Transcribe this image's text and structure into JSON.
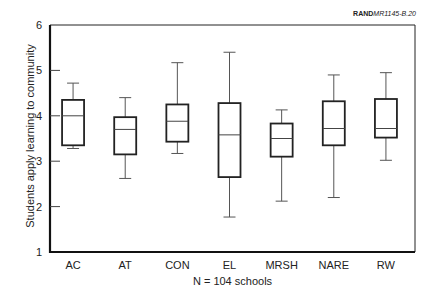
{
  "chart_data": {
    "type": "box",
    "title": "",
    "reference_id": {
      "bold": "RAND",
      "italic": "MR1145-B.20"
    },
    "xlabel": "N = 104 schools",
    "ylabel": "Students apply learning to community",
    "ylim": [
      1,
      6
    ],
    "yticks": [
      1,
      2,
      3,
      4,
      5,
      6
    ],
    "grid": false,
    "legend": null,
    "categories": [
      "AC",
      "AT",
      "CON",
      "EL",
      "MRSH",
      "NARE",
      "RW"
    ],
    "boxes": [
      {
        "name": "AC",
        "whisker_low": 3.28,
        "q1": 3.35,
        "median": 4.0,
        "q3": 4.35,
        "whisker_high": 4.72
      },
      {
        "name": "AT",
        "whisker_low": 2.62,
        "q1": 3.15,
        "median": 3.7,
        "q3": 3.97,
        "whisker_high": 4.4
      },
      {
        "name": "CON",
        "whisker_low": 3.17,
        "q1": 3.43,
        "median": 3.88,
        "q3": 4.25,
        "whisker_high": 5.17
      },
      {
        "name": "EL",
        "whisker_low": 1.77,
        "q1": 2.65,
        "median": 3.58,
        "q3": 4.28,
        "whisker_high": 5.4
      },
      {
        "name": "MRSH",
        "whisker_low": 2.12,
        "q1": 3.1,
        "median": 3.5,
        "q3": 3.83,
        "whisker_high": 4.13
      },
      {
        "name": "NARE",
        "whisker_low": 2.2,
        "q1": 3.35,
        "median": 3.72,
        "q3": 4.32,
        "whisker_high": 4.9
      },
      {
        "name": "RW",
        "whisker_low": 3.02,
        "q1": 3.52,
        "median": 3.72,
        "q3": 4.37,
        "whisker_high": 4.95
      }
    ]
  }
}
